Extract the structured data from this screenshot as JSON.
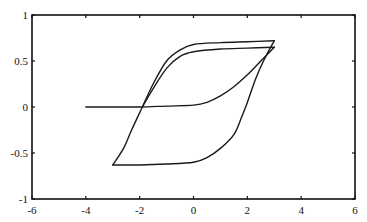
{
  "chart_data": {
    "type": "line",
    "title": "",
    "xlabel": "",
    "ylabel": "",
    "xlim": [
      -6,
      6
    ],
    "ylim": [
      -1,
      1
    ],
    "grid": false,
    "legend": "none",
    "xticks": [
      -6,
      -4,
      -2,
      0,
      2,
      4,
      6
    ],
    "yticks": [
      -1,
      -0.5,
      0,
      0.5,
      1
    ],
    "xtick_labels": [
      "-6",
      "-4",
      "-2",
      "0",
      "2",
      "4",
      "6"
    ],
    "ytick_labels": [
      "-1",
      "-0.5",
      "0",
      "0.5",
      "1"
    ],
    "series": [
      {
        "name": "initial-curve",
        "x": [
          -4,
          -3,
          -2,
          -1,
          0,
          0.5,
          1,
          1.5,
          2,
          2.5,
          3
        ],
        "y": [
          0,
          0,
          0,
          0.01,
          0.02,
          0.05,
          0.12,
          0.22,
          0.35,
          0.5,
          0.65
        ]
      },
      {
        "name": "inner-descending-branch",
        "x": [
          3,
          2,
          1,
          0,
          -0.5,
          -1,
          -1.5,
          -1.9
        ],
        "y": [
          0.65,
          0.64,
          0.63,
          0.6,
          0.55,
          0.42,
          0.2,
          0
        ]
      },
      {
        "name": "outer-descending-branch",
        "x": [
          3,
          2,
          1,
          0,
          -0.5,
          -1,
          -1.5,
          -1.9,
          -2.3,
          -2.6,
          -3
        ],
        "y": [
          0.72,
          0.71,
          0.7,
          0.68,
          0.62,
          0.5,
          0.25,
          0,
          -0.25,
          -0.45,
          -0.63
        ]
      },
      {
        "name": "ascending-branch",
        "x": [
          -3,
          -2,
          -1,
          0,
          0.5,
          1,
          1.5,
          1.8,
          2,
          2.3,
          2.6,
          3
        ],
        "y": [
          -0.63,
          -0.63,
          -0.62,
          -0.6,
          -0.55,
          -0.45,
          -0.3,
          -0.1,
          0.05,
          0.3,
          0.5,
          0.72
        ]
      }
    ]
  }
}
